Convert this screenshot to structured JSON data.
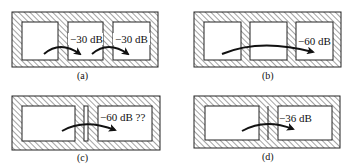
{
  "figure": {
    "panels": [
      {
        "id": "a",
        "caption": "(a)",
        "rooms": 3,
        "labels": [
          "−30 dB",
          "−30 dB"
        ],
        "arrows": 2,
        "description": "Three rooms separated by thick walls; each wall gives -30 dB"
      },
      {
        "id": "b",
        "caption": "(b)",
        "rooms": 3,
        "labels": [
          "−60 dB"
        ],
        "arrows": 1,
        "description": "Three rooms; total attenuation across two walls is -60 dB"
      },
      {
        "id": "c",
        "caption": "(c)",
        "rooms": 2,
        "labels": [
          "−60 dB ??"
        ],
        "arrows": 1,
        "description": "Two rooms separated by double wall with gap; expected -60 dB questioned"
      },
      {
        "id": "d",
        "caption": "(d)",
        "rooms": 2,
        "labels": [
          "−36 dB"
        ],
        "arrows": 1,
        "description": "Two rooms separated by double wall without gap; -36 dB"
      }
    ]
  },
  "colors": {
    "line": "#222222",
    "hatch": "#555555",
    "background": "#ffffff"
  }
}
